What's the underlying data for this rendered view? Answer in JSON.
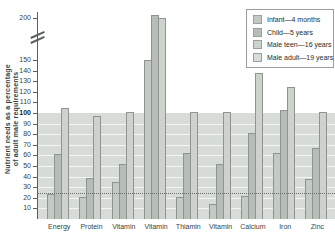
{
  "figure": {
    "y_axis_title": "Nutrient needs as a percentage of adult male requirements",
    "y_axis_title_lines": [
      "Nutrient needs as a percentage",
      "of adult male requirements"
    ]
  },
  "chart_data": {
    "type": "bar",
    "title": "",
    "categories": [
      "Energy",
      "Protein",
      "Vitamin",
      "Vitamin",
      "Thiamin",
      "Vitamin",
      "Calcium",
      "Iron",
      "Zinc"
    ],
    "series": [
      {
        "name": "Infant—4 months",
        "color": "#c4c9c4",
        "values": [
          24,
          21,
          35,
          150,
          21,
          14,
          22,
          62,
          38
        ]
      },
      {
        "name": "Child—5 years",
        "color": "#b6bcb6",
        "values": [
          61,
          39,
          52,
          203,
          62,
          52,
          81,
          103,
          67
        ]
      },
      {
        "name": "Male teen—16 years",
        "color": "#cdd2cd",
        "values": [
          105,
          97,
          101,
          200,
          101,
          101,
          138,
          125,
          101
        ]
      },
      {
        "name": "Male adult—19 years",
        "color": "#d8dcd8",
        "values": [
          100,
          100,
          100,
          100,
          100,
          100,
          100,
          100,
          100
        ],
        "render": "background-band"
      }
    ],
    "ylabel": "Nutrient needs as a percentage of adult male requirements",
    "xlabel": "",
    "y_ticks": [
      10,
      20,
      30,
      40,
      50,
      60,
      70,
      80,
      90,
      100,
      110,
      120,
      130,
      140,
      150,
      200
    ],
    "bold_tick": 100,
    "axis_break_between": [
      150,
      200
    ],
    "reference_dotted_line": 24,
    "ylim": [
      0,
      210
    ],
    "grid": "white horizontal lines every 10 units inside the 0-100 band",
    "legend_position": "top-right"
  }
}
